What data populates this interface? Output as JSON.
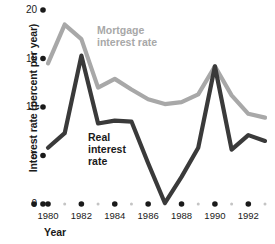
{
  "chart_data": {
    "type": "line",
    "title": "",
    "xlabel": "Year",
    "ylabel": "Interest rate (percent per year)",
    "xlim": [
      1980,
      1993
    ],
    "ylim": [
      0,
      20
    ],
    "grid": false,
    "legend_position": "inline-annotation",
    "x": [
      1980,
      1981,
      1982,
      1983,
      1984,
      1985,
      1986,
      1987,
      1988,
      1989,
      1990,
      1991,
      1992,
      1993
    ],
    "series": [
      {
        "name": "Mortgage interest rate",
        "color": "#a8a8a8",
        "values": [
          14.5,
          18.5,
          17.0,
          12.0,
          12.9,
          11.8,
          10.8,
          10.3,
          10.5,
          11.3,
          14.2,
          11.2,
          9.3,
          8.9
        ]
      },
      {
        "name": "Real interest rate",
        "color": "#3a3a3a",
        "values": [
          5.8,
          7.3,
          15.3,
          8.3,
          8.6,
          8.5,
          4.2,
          0.1,
          2.8,
          5.8,
          14.2,
          5.6,
          7.1,
          6.5
        ]
      }
    ],
    "yticks": [
      0,
      5,
      10,
      15,
      20
    ],
    "ytick_labels": [
      "0",
      "5",
      "10",
      "15",
      "20"
    ],
    "xticks": [
      1980,
      1982,
      1984,
      1986,
      1988,
      1990,
      1992
    ],
    "xtick_labels": [
      "1980",
      "1982",
      "1984",
      "1986",
      "1988",
      "1990",
      "1992"
    ],
    "minor_xticks": [
      1981,
      1983,
      1985,
      1987,
      1989,
      1991,
      1993
    ],
    "annotations": [
      {
        "text": "Mortgage\ninterest rate",
        "series": "Mortgage interest rate",
        "color": "#a8a8a8"
      },
      {
        "text": "Real\ninterest\nrate",
        "series": "Real interest rate",
        "color": "#1a1a1a"
      }
    ]
  }
}
